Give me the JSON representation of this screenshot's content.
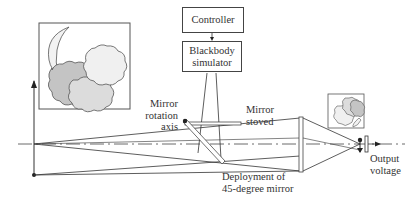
{
  "diagram": {
    "type": "optical-calibration-schematic",
    "boxes": {
      "controller": "Controller",
      "blackbody_line1": "Blackbody",
      "blackbody_line2": "simulator"
    },
    "labels": {
      "mirror_rotation_axis_1": "Mirror",
      "mirror_rotation_axis_2": "rotation",
      "mirror_rotation_axis_3": "axis",
      "mirror_stoved_1": "Mirror",
      "mirror_stoved_2": "stoved",
      "deployment_1": "Deployment of",
      "deployment_2": "45-degree mirror",
      "output_1": "Output",
      "output_2": "voltage"
    },
    "icons": [
      "moon-clouds-scene-icon",
      "inverted-moon-clouds-image-icon"
    ],
    "colors": {
      "line": "#333333",
      "cloud_dark": "#bdbdbd",
      "cloud_mid": "#d6d6d6",
      "cloud_light": "#ebebeb"
    }
  }
}
